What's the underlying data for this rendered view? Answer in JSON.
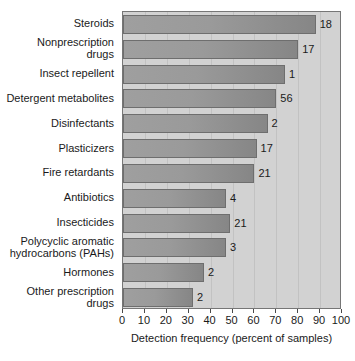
{
  "chart_data": {
    "type": "bar",
    "orientation": "horizontal",
    "title": "",
    "xlabel": "Detection frequency (percent of samples)",
    "ylabel": "",
    "xlim": [
      0,
      100
    ],
    "xticks": [
      0,
      10,
      20,
      30,
      40,
      50,
      60,
      70,
      80,
      90,
      100
    ],
    "xtick_labels": [
      "0",
      "10",
      "20",
      "30",
      "40",
      "50",
      "60",
      "70",
      "80",
      "90",
      "100"
    ],
    "grid": true,
    "grid_axis": "x",
    "legend": "none",
    "categories": [
      "Steroids",
      "Nonprescription drugs",
      "Insect repellent",
      "Detergent metabolites",
      "Disinfectants",
      "Plasticizers",
      "Fire retardants",
      "Antibiotics",
      "Insecticides",
      "Polycyclic aromatic hydrocarbons (PAHs)",
      "Hormones",
      "Other prescription drugs"
    ],
    "category_lines": [
      [
        "Steroids"
      ],
      [
        "Nonprescription",
        "drugs"
      ],
      [
        "Insect repellent"
      ],
      [
        "Detergent metabolites"
      ],
      [
        "Disinfectants"
      ],
      [
        "Plasticizers"
      ],
      [
        "Fire retardants"
      ],
      [
        "Antibiotics"
      ],
      [
        "Insecticides"
      ],
      [
        "Polycyclic aromatic",
        "hydrocarbons (PAHs)"
      ],
      [
        "Hormones"
      ],
      [
        "Other prescription",
        "drugs"
      ]
    ],
    "values": [
      88,
      80,
      74,
      70,
      66,
      61,
      60,
      47,
      49,
      47,
      37,
      32
    ],
    "bar_annotations": [
      "18",
      "17",
      "1",
      "56",
      "2",
      "17",
      "21",
      "4",
      "21",
      "3",
      "2",
      "2"
    ],
    "annotation_note": "Number at end of each bar is the count of compounds in that category",
    "colors": {
      "bar_fill_left": "#9f9f9f",
      "bar_fill_right": "#868686",
      "bar_edge": "#6e6e6e",
      "plot_background": "#d2d2d2",
      "gridline": "#c2c2c2",
      "frame": "#767676",
      "text": "#1a1a1a",
      "page_background": "#ffffff"
    }
  }
}
